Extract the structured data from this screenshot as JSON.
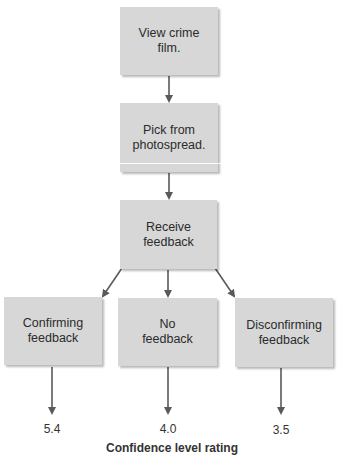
{
  "diagram": {
    "nodes": [
      {
        "id": "view",
        "lines": [
          "View crime",
          "film."
        ]
      },
      {
        "id": "pick",
        "lines": [
          "Pick from",
          "photospread."
        ]
      },
      {
        "id": "receive",
        "lines": [
          "Receive",
          "feedback"
        ]
      },
      {
        "id": "confirming",
        "lines": [
          "Confirming",
          "feedback"
        ]
      },
      {
        "id": "none",
        "lines": [
          "No",
          "feedback"
        ]
      },
      {
        "id": "disconfirming",
        "lines": [
          "Disconfirming",
          "feedback"
        ]
      }
    ],
    "edges": [
      {
        "from": "view",
        "to": "pick"
      },
      {
        "from": "pick",
        "to": "receive"
      },
      {
        "from": "receive",
        "to": "confirming"
      },
      {
        "from": "receive",
        "to": "none"
      },
      {
        "from": "receive",
        "to": "disconfirming"
      },
      {
        "from": "confirming",
        "to": "rating_confirming"
      },
      {
        "from": "none",
        "to": "rating_none"
      },
      {
        "from": "disconfirming",
        "to": "rating_disconfirming"
      }
    ],
    "ratings": {
      "confirming": "5.4",
      "none": "4.0",
      "disconfirming": "3.5"
    },
    "caption": "Confidence level rating"
  },
  "colors": {
    "box_fill": "#d7d7d7",
    "arrow": "#5a5a5a"
  }
}
